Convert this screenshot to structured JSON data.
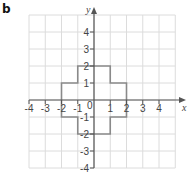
{
  "part_label": "b",
  "axes": {
    "x_label": "x",
    "y_label": "y",
    "x_range": [
      -4,
      5
    ],
    "y_range": [
      -4,
      5
    ],
    "x_ticks": [
      "-4",
      "-3",
      "-2",
      "-1",
      "1",
      "2",
      "3",
      "4"
    ],
    "y_ticks": [
      "4",
      "3",
      "2",
      "1",
      "-1",
      "-2",
      "-3",
      "-4"
    ],
    "origin_label": "0"
  },
  "shape": {
    "name": "cross-shaped polygon",
    "vertices": [
      [
        -1,
        2
      ],
      [
        1,
        2
      ],
      [
        1,
        1
      ],
      [
        2,
        1
      ],
      [
        2,
        -1
      ],
      [
        1,
        -1
      ],
      [
        1,
        -2
      ],
      [
        -1,
        -2
      ],
      [
        -1,
        -1
      ],
      [
        -2,
        -1
      ],
      [
        -2,
        1
      ],
      [
        -1,
        1
      ]
    ]
  },
  "colors": {
    "grid": "#dcdcdc",
    "axis": "#555555",
    "shape": "#8a8a8a",
    "text": "#444444"
  }
}
